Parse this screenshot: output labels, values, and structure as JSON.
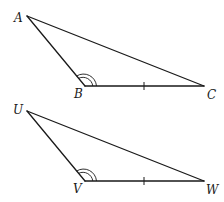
{
  "figure": {
    "triangles": [
      {
        "name": "ABC",
        "vertices": [
          {
            "label": "A",
            "x": 27,
            "y": 16,
            "label_x": 14,
            "label_y": 22
          },
          {
            "label": "B",
            "x": 85,
            "y": 86,
            "label_x": 74,
            "label_y": 98
          },
          {
            "label": "C",
            "x": 204,
            "y": 86,
            "label_x": 207,
            "label_y": 99
          }
        ],
        "angle_marks": [
          {
            "vertex": "B",
            "type": "double-arc"
          }
        ],
        "side_marks": [
          {
            "side": "BC",
            "type": "single-tick"
          }
        ]
      },
      {
        "name": "UVW",
        "vertices": [
          {
            "label": "U",
            "x": 27,
            "y": 111,
            "label_x": 13,
            "label_y": 114
          },
          {
            "label": "V",
            "x": 85,
            "y": 181,
            "label_x": 73,
            "label_y": 193
          },
          {
            "label": "W",
            "x": 204,
            "y": 181,
            "label_x": 206,
            "label_y": 194
          }
        ],
        "angle_marks": [
          {
            "vertex": "V",
            "type": "double-arc"
          }
        ],
        "side_marks": [
          {
            "side": "VW",
            "type": "single-tick"
          }
        ]
      }
    ]
  }
}
